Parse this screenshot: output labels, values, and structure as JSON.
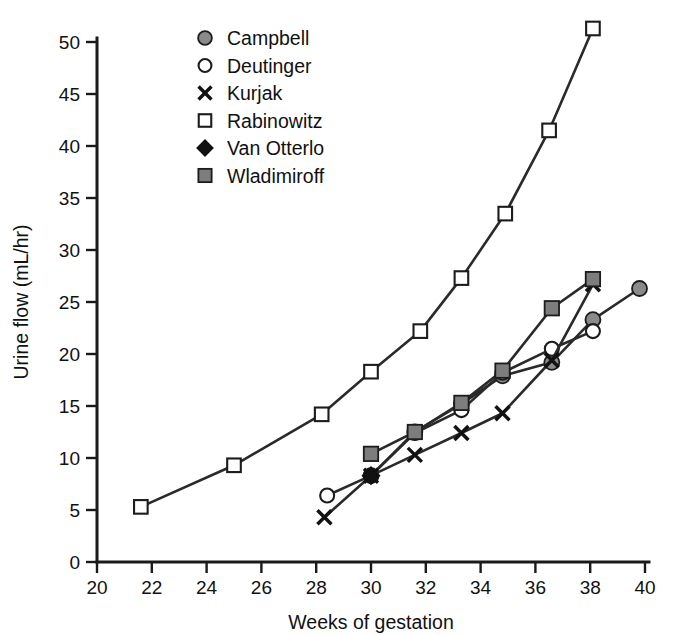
{
  "chart_data": {
    "type": "line",
    "title": "",
    "xlabel": "Weeks of gestation",
    "ylabel": "Urine flow (mL/hr)",
    "xlim": [
      20,
      40
    ],
    "ylim": [
      0,
      50
    ],
    "xticks": [
      20,
      22,
      24,
      26,
      28,
      30,
      32,
      34,
      36,
      38,
      40
    ],
    "yticks": [
      0,
      5,
      10,
      15,
      20,
      25,
      30,
      35,
      40,
      45,
      50
    ],
    "grid": false,
    "legend_position": "upper-left-inside",
    "series": [
      {
        "name": "Campbell",
        "marker": "filled-circle",
        "color": "#8a8a8a",
        "x": [
          30.0,
          31.6,
          33.3,
          34.8,
          36.6,
          38.1,
          39.8
        ],
        "y": [
          8.3,
          12.5,
          15.2,
          17.9,
          19.2,
          23.3,
          26.3
        ]
      },
      {
        "name": "Deutinger",
        "marker": "open-circle",
        "color": "#ffffff",
        "x": [
          28.4,
          30.0,
          31.6,
          33.3,
          34.8,
          36.6,
          38.1
        ],
        "y": [
          6.4,
          8.3,
          12.4,
          14.6,
          18.2,
          20.5,
          22.2
        ]
      },
      {
        "name": "Kurjak",
        "marker": "cross",
        "color": "#121212",
        "x": [
          28.3,
          30.0,
          31.6,
          33.3,
          34.8,
          36.6,
          38.1
        ],
        "y": [
          4.3,
          8.3,
          10.3,
          12.4,
          14.3,
          19.4,
          26.7
        ]
      },
      {
        "name": "Rabinowitz",
        "marker": "open-square",
        "color": "#ffffff",
        "x": [
          21.6,
          25.0,
          28.2,
          30.0,
          31.8,
          33.3,
          34.9,
          36.5,
          38.1
        ],
        "y": [
          5.3,
          9.3,
          14.2,
          18.3,
          22.2,
          27.3,
          33.5,
          41.5,
          51.3
        ]
      },
      {
        "name": "Van Otterlo",
        "marker": "diamond",
        "color": "#111111",
        "x": [
          30.0
        ],
        "y": [
          8.3
        ]
      },
      {
        "name": "Wladimiroff",
        "marker": "filled-square",
        "color": "#7d7d7d",
        "x": [
          30.0,
          31.6,
          33.3,
          34.8,
          36.6,
          38.1
        ],
        "y": [
          10.4,
          12.5,
          15.3,
          18.4,
          24.4,
          27.2
        ]
      }
    ]
  },
  "legend": {
    "entries": [
      {
        "label": "Campbell",
        "marker": "filled-circle"
      },
      {
        "label": "Deutinger",
        "marker": "open-circle"
      },
      {
        "label": "Kurjak",
        "marker": "cross"
      },
      {
        "label": "Rabinowitz",
        "marker": "open-square"
      },
      {
        "label": "Van Otterlo",
        "marker": "diamond"
      },
      {
        "label": "Wladimiroff",
        "marker": "filled-square"
      }
    ]
  }
}
